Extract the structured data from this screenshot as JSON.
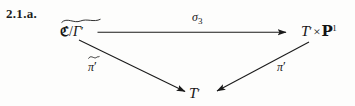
{
  "figure": {
    "number_label": "2.1.a.",
    "type": "commutative-diagram",
    "background_color": "#fdfdfc",
    "ink_color": "#1a1a1a"
  },
  "nodes": {
    "source": {
      "id": "source",
      "latex": "\\widetilde{\\mathfrak{B}/\\Gamma'}",
      "frak_symbol": "ℭ",
      "slash": "/",
      "gamma": "Γ",
      "prime": "′",
      "accent": "widetilde"
    },
    "target": {
      "id": "target",
      "latex": "T' \\times \\mathbb{P}^1",
      "base": "T",
      "prime": "′",
      "times": "×",
      "blackboard_p": "P",
      "exponent": "1"
    },
    "bottom": {
      "id": "bottom",
      "latex": "T'",
      "base": "T",
      "prime": "′"
    }
  },
  "arrows": [
    {
      "name": "sigma-3-arrow",
      "from": "source",
      "to": "target",
      "direction": "right",
      "label": {
        "base": "σ",
        "subscript": "3",
        "position": "above"
      }
    },
    {
      "name": "pi-tilde-prime-arrow",
      "from": "source",
      "to": "bottom",
      "direction": "down-right",
      "label": {
        "base": "π",
        "prime": "′",
        "accent": "tilde",
        "position": "left"
      }
    },
    {
      "name": "pi-prime-arrow",
      "from": "target",
      "to": "bottom",
      "direction": "down-left",
      "label": {
        "base": "π",
        "prime": "′",
        "position": "right"
      }
    }
  ]
}
